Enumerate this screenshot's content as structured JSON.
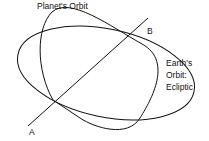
{
  "diagram": {
    "labels": {
      "planet_orbit": "Planet's Orbit",
      "point_b": "B",
      "point_a": "A",
      "earth_orbit_line1": "Earth's",
      "earth_orbit_line2": "Orbit:",
      "earth_orbit_line3": "Ecliptic"
    },
    "colors": {
      "stroke": "#111111",
      "background": "#ffffff"
    }
  }
}
